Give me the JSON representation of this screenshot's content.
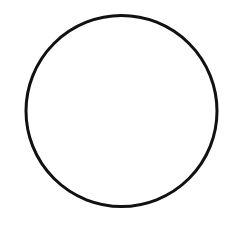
{
  "canvas": {
    "width": 238,
    "height": 241,
    "background": "#ffffff"
  },
  "shapes": [
    {
      "type": "circle",
      "cx": 121.5,
      "cy": 111,
      "r": 95.5,
      "stroke": "#111111",
      "stroke_width": 3,
      "fill": "none"
    }
  ]
}
